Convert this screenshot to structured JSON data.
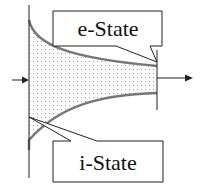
{
  "diagram": {
    "labels": {
      "top_callout": "e-State",
      "bottom_callout": "i-State"
    },
    "colors": {
      "line": "#222222",
      "curve": "#777777",
      "fill_dots": "#9a9a9a",
      "background": "#ffffff"
    }
  }
}
